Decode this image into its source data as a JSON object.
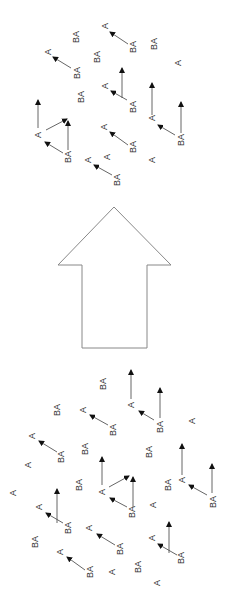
{
  "diagram": {
    "colors": {
      "text": "#333333",
      "line": "#555555",
      "head": "#111111",
      "big_arrow": "#888888",
      "background": "#ffffff"
    },
    "big_arrow": {
      "direction": "up",
      "points": [
        [
          114,
          207
        ],
        [
          171,
          265
        ],
        [
          147,
          265
        ],
        [
          147,
          348
        ],
        [
          82,
          348
        ],
        [
          82,
          265
        ],
        [
          58,
          265
        ]
      ]
    },
    "top_cluster": {
      "labels": [
        {
          "text": "BA",
          "x": 76,
          "y": 37
        },
        {
          "text": "A",
          "x": 105,
          "y": 26
        },
        {
          "text": "BA",
          "x": 133,
          "y": 47
        },
        {
          "text": "BA",
          "x": 154,
          "y": 44
        },
        {
          "text": "A",
          "x": 48,
          "y": 52
        },
        {
          "text": "BA",
          "x": 77,
          "y": 73
        },
        {
          "text": "BA",
          "x": 97,
          "y": 57
        },
        {
          "text": "A",
          "x": 178,
          "y": 63
        },
        {
          "text": "A",
          "x": 105,
          "y": 86
        },
        {
          "text": "BA",
          "x": 133,
          "y": 107
        },
        {
          "text": "BA",
          "x": 81,
          "y": 97
        },
        {
          "text": "A",
          "x": 152,
          "y": 118
        },
        {
          "text": "BA",
          "x": 181,
          "y": 140
        },
        {
          "text": "A",
          "x": 38,
          "y": 135
        },
        {
          "text": "BA",
          "x": 68,
          "y": 157
        },
        {
          "text": "A",
          "x": 104,
          "y": 127
        },
        {
          "text": "BA",
          "x": 133,
          "y": 147
        },
        {
          "text": "A",
          "x": 107,
          "y": 157
        },
        {
          "text": "A",
          "x": 152,
          "y": 160
        },
        {
          "text": "A",
          "x": 88,
          "y": 160
        },
        {
          "text": "BA",
          "x": 117,
          "y": 180
        }
      ],
      "arrows": [
        {
          "x1": 128,
          "y1": 44,
          "x2": 110,
          "y2": 32
        },
        {
          "x1": 71,
          "y1": 68,
          "x2": 53,
          "y2": 57
        },
        {
          "x1": 122,
          "y1": 98,
          "x2": 122,
          "y2": 68
        },
        {
          "x1": 127,
          "y1": 100,
          "x2": 111,
          "y2": 91
        },
        {
          "x1": 152,
          "y1": 115,
          "x2": 152,
          "y2": 83
        },
        {
          "x1": 175,
          "y1": 135,
          "x2": 158,
          "y2": 125
        },
        {
          "x1": 181,
          "y1": 133,
          "x2": 181,
          "y2": 102
        },
        {
          "x1": 38,
          "y1": 128,
          "x2": 38,
          "y2": 100
        },
        {
          "x1": 46,
          "y1": 130,
          "x2": 67,
          "y2": 119
        },
        {
          "x1": 68,
          "y1": 150,
          "x2": 68,
          "y2": 121
        },
        {
          "x1": 63,
          "y1": 153,
          "x2": 45,
          "y2": 142
        },
        {
          "x1": 128,
          "y1": 145,
          "x2": 110,
          "y2": 132
        },
        {
          "x1": 112,
          "y1": 175,
          "x2": 94,
          "y2": 165
        }
      ]
    },
    "bottom_cluster": {
      "labels": [
        {
          "text": "BA",
          "x": 103,
          "y": 384
        },
        {
          "text": "A",
          "x": 131,
          "y": 405
        },
        {
          "text": "BA",
          "x": 160,
          "y": 427
        },
        {
          "text": "A",
          "x": 192,
          "y": 421
        },
        {
          "text": "BA",
          "x": 57,
          "y": 410
        },
        {
          "text": "A",
          "x": 83,
          "y": 410
        },
        {
          "text": "BA",
          "x": 113,
          "y": 430
        },
        {
          "text": "A",
          "x": 32,
          "y": 436
        },
        {
          "text": "BA",
          "x": 61,
          "y": 457
        },
        {
          "text": "BA",
          "x": 85,
          "y": 449
        },
        {
          "text": "BA",
          "x": 149,
          "y": 452
        },
        {
          "text": "A",
          "x": 28,
          "y": 465
        },
        {
          "text": "A",
          "x": 182,
          "y": 480
        },
        {
          "text": "BA",
          "x": 213,
          "y": 502
        },
        {
          "text": "BA",
          "x": 168,
          "y": 485
        },
        {
          "text": "BA",
          "x": 79,
          "y": 485
        },
        {
          "text": "A",
          "x": 102,
          "y": 492
        },
        {
          "text": "BA",
          "x": 132,
          "y": 512
        },
        {
          "text": "A",
          "x": 153,
          "y": 505
        },
        {
          "text": "A",
          "x": 13,
          "y": 493
        },
        {
          "text": "A",
          "x": 39,
          "y": 507
        },
        {
          "text": "BA",
          "x": 68,
          "y": 528
        },
        {
          "text": "A",
          "x": 89,
          "y": 528
        },
        {
          "text": "BA",
          "x": 120,
          "y": 549
        },
        {
          "text": "BA",
          "x": 35,
          "y": 542
        },
        {
          "text": "A",
          "x": 152,
          "y": 538
        },
        {
          "text": "BA",
          "x": 181,
          "y": 558
        },
        {
          "text": "A",
          "x": 60,
          "y": 552
        },
        {
          "text": "BA",
          "x": 90,
          "y": 572
        },
        {
          "text": "A",
          "x": 112,
          "y": 572
        },
        {
          "text": "BA",
          "x": 138,
          "y": 567
        },
        {
          "text": "A",
          "x": 157,
          "y": 583
        }
      ],
      "arrows": [
        {
          "x1": 131,
          "y1": 399,
          "x2": 131,
          "y2": 370
        },
        {
          "x1": 154,
          "y1": 420,
          "x2": 139,
          "y2": 411
        },
        {
          "x1": 160,
          "y1": 418,
          "x2": 160,
          "y2": 388
        },
        {
          "x1": 108,
          "y1": 425,
          "x2": 90,
          "y2": 415
        },
        {
          "x1": 57,
          "y1": 452,
          "x2": 39,
          "y2": 441
        },
        {
          "x1": 182,
          "y1": 475,
          "x2": 182,
          "y2": 444
        },
        {
          "x1": 102,
          "y1": 485,
          "x2": 102,
          "y2": 457
        },
        {
          "x1": 207,
          "y1": 495,
          "x2": 189,
          "y2": 485
        },
        {
          "x1": 212,
          "y1": 493,
          "x2": 212,
          "y2": 464
        },
        {
          "x1": 109,
          "y1": 487,
          "x2": 129,
          "y2": 476
        },
        {
          "x1": 133,
          "y1": 507,
          "x2": 133,
          "y2": 477
        },
        {
          "x1": 127,
          "y1": 507,
          "x2": 110,
          "y2": 498
        },
        {
          "x1": 57,
          "y1": 523,
          "x2": 57,
          "y2": 489
        },
        {
          "x1": 63,
          "y1": 523,
          "x2": 46,
          "y2": 513
        },
        {
          "x1": 115,
          "y1": 545,
          "x2": 97,
          "y2": 534
        },
        {
          "x1": 169,
          "y1": 553,
          "x2": 169,
          "y2": 522
        },
        {
          "x1": 177,
          "y1": 555,
          "x2": 158,
          "y2": 544
        },
        {
          "x1": 85,
          "y1": 570,
          "x2": 67,
          "y2": 557
        }
      ]
    }
  }
}
